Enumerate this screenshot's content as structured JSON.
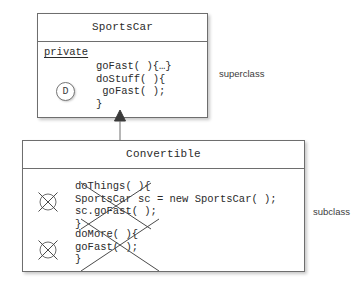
{
  "diagram": {
    "type": "uml-class-diagram",
    "relationship": "generalization",
    "stroke_color": "#6e6e6e",
    "text_color": "#2b2b2b",
    "background": "#ffffff"
  },
  "superclass": {
    "name": "SportsCar",
    "side_label": "superclass",
    "access_modifier": "private",
    "badge": "D",
    "badge_meaning": "default-access-marker",
    "methods": "goFast( ){…}\ndoStuff( ){\n goFast( );\n}"
  },
  "subclass": {
    "name": "Convertible",
    "side_label": "subclass",
    "marker": "X",
    "method_blocks": [
      {
        "code": "doThings( ){\nSportsCar sc = new SportsCar( );\nsc.goFast( );\n}",
        "struck_out": true
      },
      {
        "code": "doMore( ){\ngoFast( );\n}",
        "struck_out": true
      }
    ]
  }
}
